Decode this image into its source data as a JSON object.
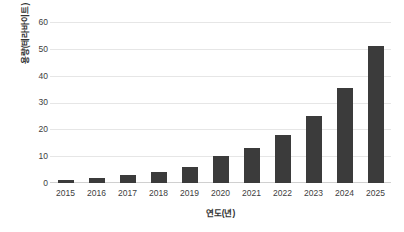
{
  "chart_data": {
    "type": "bar",
    "title": "",
    "xlabel": "연도(년)",
    "ylabel": "용량(테라바이트)",
    "categories": [
      "2015",
      "2016",
      "2017",
      "2018",
      "2019",
      "2020",
      "2021",
      "2022",
      "2023",
      "2024",
      "2025"
    ],
    "values": [
      1.2,
      2,
      3,
      4.2,
      6,
      10,
      13,
      18,
      25,
      35.5,
      51
    ],
    "ylim": [
      0,
      60
    ],
    "yticks": [
      0,
      10,
      20,
      30,
      40,
      50,
      60
    ],
    "ytick_labels": [
      "0",
      "10",
      "20",
      "30",
      "40",
      "50",
      "60"
    ],
    "grid": true,
    "legend": false,
    "legend_position": "none",
    "bar_color": "#3b3b3b",
    "grid_color": "#e6e6e6",
    "background_color": "#ffffff",
    "text_color": "#404040"
  }
}
